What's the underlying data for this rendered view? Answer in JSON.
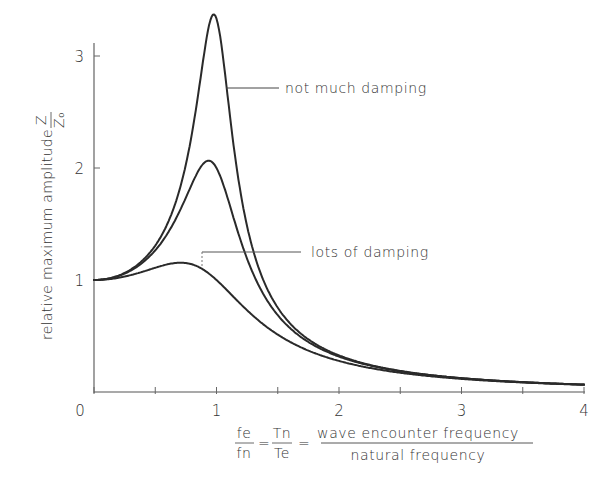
{
  "chart_data": {
    "type": "line",
    "title": "",
    "xlabel": {
      "lhs1_num": "fe",
      "lhs1_den": "fn",
      "lhs2_num": "Tn",
      "lhs2_den": "Te",
      "equals": "=",
      "numerator": "wave encounter frequency",
      "denominator": "natural frequency"
    },
    "ylabel": {
      "text": "relative maximum amplitude",
      "frac_num": "Z",
      "frac_den": "Z₀"
    },
    "xlim": [
      0,
      4
    ],
    "ylim": [
      0,
      3.1
    ],
    "x_ticks": [
      0,
      0.5,
      1,
      1.5,
      2,
      2.5,
      3,
      3.5,
      4
    ],
    "x_tick_labels": [
      "0",
      "1",
      "2",
      "3",
      "4"
    ],
    "x_tick_label_values": [
      0,
      1,
      2,
      3,
      4
    ],
    "y_ticks": [
      1,
      2,
      3
    ],
    "y_tick_labels": [
      "1",
      "2",
      "3"
    ],
    "grid": false,
    "legend": "none",
    "series": [
      {
        "name": "not much damping",
        "damping_ratio": 0.15,
        "peak": {
          "x": 0.97,
          "y": 3.31
        },
        "x": [
          0,
          0.5,
          0.8,
          0.9,
          0.97,
          1.1,
          1.3,
          1.5,
          2,
          3,
          4
        ],
        "values": [
          1.0,
          1.3,
          2.3,
          2.9,
          3.31,
          2.5,
          1.2,
          0.7,
          0.33,
          0.12,
          0.07
        ]
      },
      {
        "name": "medium damping",
        "damping_ratio": 0.25,
        "peak": {
          "x": 0.94,
          "y": 2.0
        },
        "x": [
          0,
          0.5,
          0.8,
          0.94,
          1.1,
          1.3,
          1.5,
          2,
          3,
          4
        ],
        "values": [
          1.0,
          1.28,
          1.8,
          2.0,
          1.75,
          1.05,
          0.7,
          0.32,
          0.12,
          0.07
        ]
      },
      {
        "name": "lots of damping",
        "damping_ratio": 0.5,
        "peak": {
          "x": 0.7,
          "y": 1.15
        },
        "x": [
          0,
          0.3,
          0.5,
          0.7,
          0.9,
          1.0,
          1.3,
          1.5,
          2,
          3,
          4
        ],
        "values": [
          1.0,
          1.04,
          1.1,
          1.15,
          1.1,
          1.0,
          0.7,
          0.53,
          0.29,
          0.12,
          0.07
        ]
      }
    ],
    "annotations": [
      {
        "text": "not much damping",
        "points_to": "series 0 at x≈1.05"
      },
      {
        "text": "lots of damping",
        "points_to": "series 2 at x≈0.9"
      }
    ]
  },
  "style": {
    "line_color": "#2a2a2a",
    "axis_color": "#555555",
    "text_color": "#333333"
  }
}
